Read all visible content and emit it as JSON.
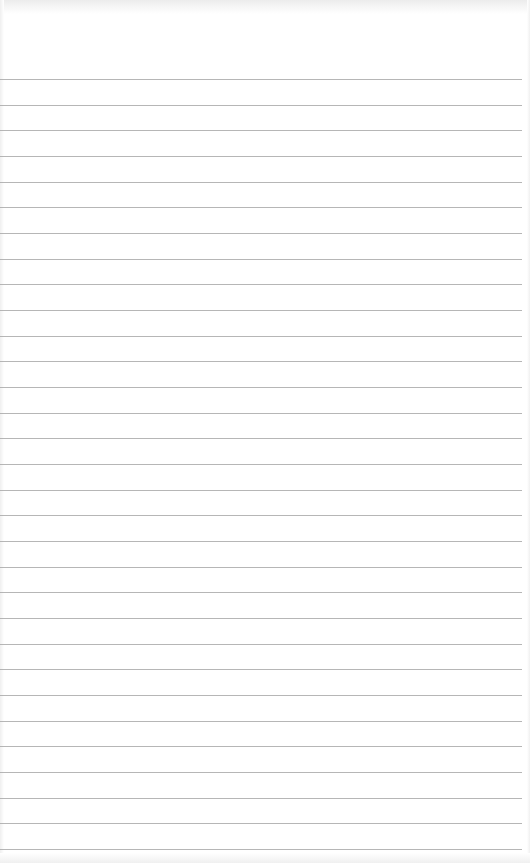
{
  "notepad": {
    "line_count": 31,
    "first_line_y": 79,
    "line_spacing": 25.67,
    "line_color": "#a9a9a9",
    "paper_color": "#ffffff",
    "lines": [
      "",
      "",
      "",
      "",
      "",
      "",
      "",
      "",
      "",
      "",
      "",
      "",
      "",
      "",
      "",
      "",
      "",
      "",
      "",
      "",
      "",
      "",
      "",
      "",
      "",
      "",
      "",
      "",
      "",
      "",
      ""
    ]
  }
}
